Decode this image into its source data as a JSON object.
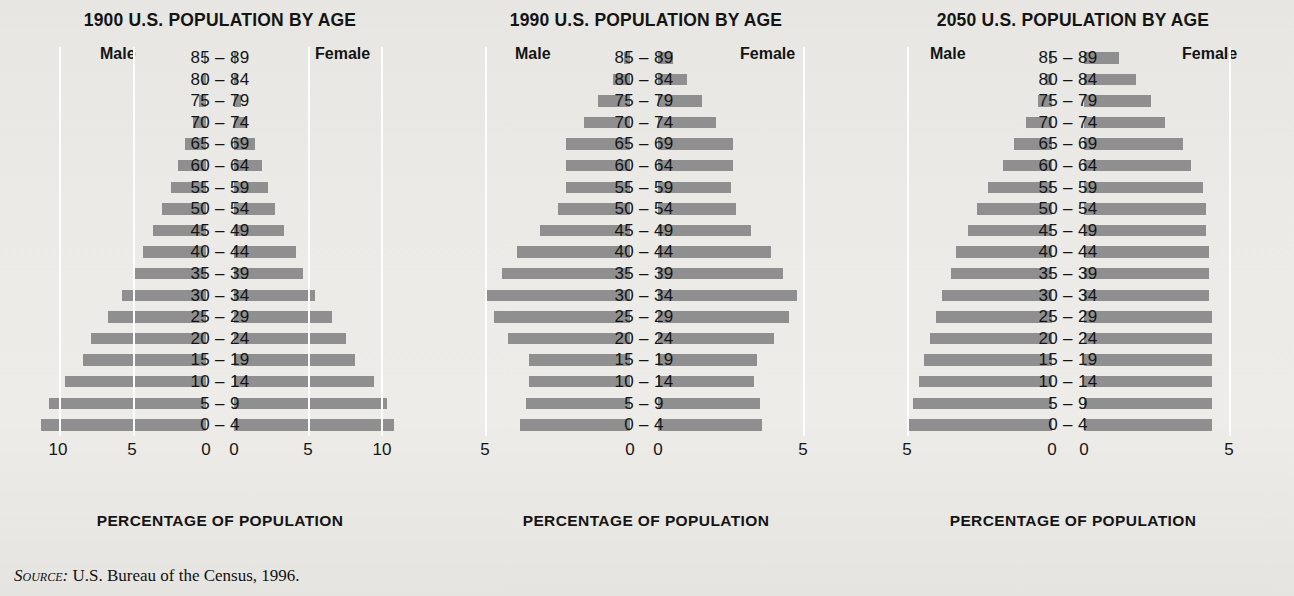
{
  "figure": {
    "source_prefix": "Source:",
    "source_text": "U.S. Bureau of the Census, 1996.",
    "bar_color": "#8f8f8f",
    "gridline_color": "#fdfdfd",
    "background_color": "#e9e8e4",
    "age_groups": [
      "85 – 89",
      "80 – 84",
      "75 – 79",
      "70 – 74",
      "65 – 69",
      "60 – 64",
      "55 – 59",
      "50 – 54",
      "45 – 49",
      "40 – 44",
      "35 – 39",
      "30 – 34",
      "25 – 29",
      "20 – 24",
      "15 – 19",
      "10 – 14",
      "5 – 9",
      "0 – 4"
    ],
    "male_label": "Male",
    "female_label": "Female",
    "axis_title": "PERCENTAGE OF POPULATION"
  },
  "chart_data": [
    {
      "type": "bar",
      "title": "1900 U.S. POPULATION BY AGE",
      "xlabel": "PERCENTAGE OF POPULATION",
      "ylabel": "",
      "orientation": "population-pyramid",
      "categories": [
        "85 – 89",
        "80 – 84",
        "75 – 79",
        "70 – 74",
        "65 – 69",
        "60 – 64",
        "55 – 59",
        "50 – 54",
        "45 – 49",
        "40 – 44",
        "35 – 39",
        "30 – 34",
        "25 – 29",
        "20 – 24",
        "15 – 19",
        "10 – 14",
        "5 – 9",
        "0 – 4"
      ],
      "series": [
        {
          "name": "Male",
          "values": [
            0.1,
            0.3,
            0.5,
            0.9,
            1.4,
            1.9,
            2.4,
            3.0,
            3.6,
            4.3,
            4.9,
            5.7,
            6.7,
            7.8,
            8.4,
            9.6,
            10.7,
            11.2
          ]
        },
        {
          "name": "Female",
          "values": [
            0.1,
            0.3,
            0.5,
            0.9,
            1.4,
            1.9,
            2.3,
            2.8,
            3.4,
            4.2,
            4.7,
            5.5,
            6.7,
            7.6,
            8.2,
            9.5,
            10.4,
            10.9
          ]
        }
      ],
      "left_ticks": [
        "10",
        "5",
        "0"
      ],
      "right_ticks": [
        "0",
        "5",
        "10"
      ],
      "xlim": [
        0,
        12
      ],
      "grid": true,
      "legend_position": "top"
    },
    {
      "type": "bar",
      "title": "1990 U.S. POPULATION BY AGE",
      "xlabel": "PERCENTAGE OF POPULATION",
      "ylabel": "",
      "orientation": "population-pyramid",
      "categories": [
        "85 – 89",
        "80 – 84",
        "75 – 79",
        "70 – 74",
        "65 – 69",
        "60 – 64",
        "55 – 59",
        "50 – 54",
        "45 – 49",
        "40 – 44",
        "35 – 39",
        "30 – 34",
        "25 – 29",
        "20 – 24",
        "15 – 19",
        "10 – 14",
        "5 – 9",
        "0 – 4"
      ],
      "series": [
        {
          "name": "Male",
          "values": [
            0.2,
            0.6,
            1.1,
            1.6,
            2.2,
            2.2,
            2.2,
            2.5,
            3.1,
            3.9,
            4.4,
            5.0,
            4.7,
            4.2,
            3.5,
            3.5,
            3.6,
            3.8
          ]
        },
        {
          "name": "Female",
          "values": [
            0.5,
            1.0,
            1.5,
            2.0,
            2.6,
            2.6,
            2.5,
            2.7,
            3.2,
            3.9,
            4.3,
            4.8,
            4.5,
            4.0,
            3.4,
            3.3,
            3.5,
            3.6
          ]
        }
      ],
      "left_ticks": [
        "5",
        "0"
      ],
      "right_ticks": [
        "0",
        "5"
      ],
      "xlim": [
        0,
        6
      ],
      "grid": true,
      "legend_position": "top"
    },
    {
      "type": "bar",
      "title": "2050 U.S. POPULATION BY AGE",
      "xlabel": "PERCENTAGE OF POPULATION",
      "ylabel": "",
      "orientation": "population-pyramid",
      "categories": [
        "85 – 89",
        "80 – 84",
        "75 – 79",
        "70 – 74",
        "65 – 69",
        "60 – 64",
        "55 – 59",
        "50 – 54",
        "45 – 49",
        "40 – 44",
        "35 – 39",
        "30 – 34",
        "25 – 29",
        "20 – 24",
        "15 – 19",
        "10 – 14",
        "5 – 9",
        "0 – 4"
      ],
      "series": [
        {
          "name": "Male",
          "values": [
            0.1,
            0.2,
            0.5,
            0.9,
            1.3,
            1.7,
            2.2,
            2.6,
            2.9,
            3.3,
            3.5,
            3.8,
            4.0,
            4.2,
            4.4,
            4.6,
            4.8,
            5.0
          ]
        },
        {
          "name": "Female",
          "values": [
            1.2,
            1.8,
            2.3,
            2.8,
            3.4,
            3.7,
            4.1,
            4.2,
            4.2,
            4.3,
            4.3,
            4.3,
            4.4,
            4.4,
            4.4,
            4.4,
            4.4,
            4.4
          ]
        }
      ],
      "left_ticks": [
        "5",
        "0"
      ],
      "right_ticks": [
        "0",
        "5"
      ],
      "xlim": [
        0,
        5.6
      ],
      "grid": true,
      "legend_position": "top"
    }
  ]
}
